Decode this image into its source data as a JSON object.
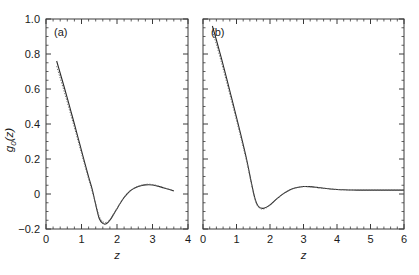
{
  "figure": {
    "background_color": "#ffffff",
    "axis_color": "#3a3a3a",
    "curve_solid_color": "#2b2b2b",
    "curve_dotted_color": "#6e6e6e",
    "ylabel_parts": {
      "g": "g",
      "sub": "0",
      "z": "(z)"
    },
    "xlabel": "z"
  },
  "chart_data": [
    {
      "type": "line",
      "panel_label": "(a)",
      "title": "",
      "xlabel": "z",
      "ylabel": "g0(z)",
      "xlim": [
        0,
        4
      ],
      "ylim": [
        -0.2,
        1.0
      ],
      "xticks": [
        0,
        1,
        2,
        3,
        4
      ],
      "xtick_labels": [
        "0",
        "1",
        "2",
        "3",
        "4"
      ],
      "yticks": [
        -0.2,
        0,
        0.2,
        0.4,
        0.6,
        0.8,
        1.0
      ],
      "ytick_labels": [
        "-0.2",
        "0",
        "0.2",
        "0.4",
        "0.6",
        "0.8",
        "1.0"
      ],
      "xminor_step": 0.2,
      "yminor_step": 0.05,
      "grid": false,
      "legend": "none",
      "series": [
        {
          "name": "solid",
          "style": "solid",
          "x": [
            0.3,
            0.4,
            0.5,
            0.6,
            0.7,
            0.8,
            0.9,
            1.0,
            1.1,
            1.2,
            1.3,
            1.4,
            1.5,
            1.6,
            1.7,
            1.8,
            1.9,
            2.0,
            2.1,
            2.2,
            2.3,
            2.4,
            2.5,
            2.6,
            2.7,
            2.8,
            2.9,
            3.0,
            3.1,
            3.2,
            3.3,
            3.4,
            3.5,
            3.6
          ],
          "y": [
            0.76,
            0.69,
            0.62,
            0.548,
            0.474,
            0.4,
            0.324,
            0.248,
            0.172,
            0.098,
            0.028,
            -0.06,
            -0.14,
            -0.168,
            -0.17,
            -0.15,
            -0.118,
            -0.084,
            -0.05,
            -0.02,
            0.004,
            0.022,
            0.034,
            0.043,
            0.049,
            0.052,
            0.053,
            0.051,
            0.047,
            0.042,
            0.036,
            0.03,
            0.024,
            0.018
          ]
        },
        {
          "name": "dotted",
          "style": "dotted",
          "x": [
            0.3,
            0.4,
            0.5,
            0.6,
            0.7,
            0.8,
            0.9,
            1.0,
            1.1,
            1.2,
            1.3,
            1.4,
            1.5,
            1.6,
            1.7,
            1.8,
            1.9,
            2.0,
            2.1,
            2.2,
            2.3,
            2.4,
            2.5,
            2.6,
            2.7,
            2.8,
            2.9,
            3.0,
            3.1,
            3.2,
            3.3,
            3.4,
            3.5,
            3.6
          ],
          "y": [
            0.73,
            0.662,
            0.594,
            0.524,
            0.452,
            0.38,
            0.306,
            0.232,
            0.158,
            0.086,
            0.016,
            -0.058,
            -0.128,
            -0.158,
            -0.162,
            -0.146,
            -0.116,
            -0.082,
            -0.048,
            -0.018,
            0.006,
            0.024,
            0.036,
            0.045,
            0.051,
            0.055,
            0.056,
            0.054,
            0.05,
            0.044,
            0.038,
            0.031,
            0.025,
            0.019
          ]
        }
      ]
    },
    {
      "type": "line",
      "panel_label": "(b)",
      "title": "",
      "xlabel": "z",
      "ylabel": "g0(z)",
      "xlim": [
        0,
        6
      ],
      "ylim": [
        -0.2,
        1.0
      ],
      "xticks": [
        0,
        1,
        2,
        3,
        4,
        5,
        6
      ],
      "xtick_labels": [
        "0",
        "1",
        "2",
        "3",
        "4",
        "5",
        "6"
      ],
      "yticks": [
        -0.2,
        0,
        0.2,
        0.4,
        0.6,
        0.8,
        1.0
      ],
      "ytick_labels": [
        "-0.2",
        "0",
        "0.2",
        "0.4",
        "0.6",
        "0.8",
        "1.0"
      ],
      "xminor_step": 0.2,
      "yminor_step": 0.05,
      "grid": false,
      "legend": "none",
      "series": [
        {
          "name": "solid",
          "style": "solid",
          "x": [
            0.28,
            0.4,
            0.55,
            0.7,
            0.85,
            1.0,
            1.15,
            1.3,
            1.45,
            1.55,
            1.65,
            1.8,
            2.0,
            2.2,
            2.4,
            2.6,
            2.8,
            3.0,
            3.2,
            3.4,
            3.6,
            3.8,
            4.0,
            4.2,
            4.4,
            4.6,
            4.8,
            5.0,
            5.2,
            5.4,
            5.6,
            5.8,
            6.0
          ],
          "y": [
            0.96,
            0.88,
            0.775,
            0.665,
            0.552,
            0.438,
            0.322,
            0.2,
            0.06,
            -0.025,
            -0.07,
            -0.082,
            -0.062,
            -0.028,
            0.002,
            0.024,
            0.037,
            0.043,
            0.042,
            0.038,
            0.033,
            0.029,
            0.026,
            0.024,
            0.023,
            0.022,
            0.022,
            0.022,
            0.022,
            0.022,
            0.022,
            0.022,
            0.022
          ]
        },
        {
          "name": "dotted",
          "style": "dotted",
          "x": [
            0.28,
            0.4,
            0.55,
            0.7,
            0.85,
            1.0,
            1.15,
            1.3,
            1.45,
            1.55,
            1.65,
            1.8,
            2.0,
            2.2,
            2.4,
            2.6,
            2.8,
            3.0,
            3.2,
            3.4,
            3.6,
            3.8,
            4.0,
            4.2,
            4.4,
            4.6,
            4.8,
            5.0,
            5.2,
            5.4,
            5.6,
            5.8,
            6.0
          ],
          "y": [
            0.93,
            0.855,
            0.752,
            0.644,
            0.533,
            0.421,
            0.307,
            0.188,
            0.052,
            -0.03,
            -0.074,
            -0.086,
            -0.065,
            -0.03,
            0.001,
            0.023,
            0.036,
            0.042,
            0.041,
            0.037,
            0.033,
            0.029,
            0.026,
            0.024,
            0.023,
            0.022,
            0.022,
            0.022,
            0.022,
            0.022,
            0.022,
            0.022,
            0.022
          ]
        }
      ]
    }
  ]
}
